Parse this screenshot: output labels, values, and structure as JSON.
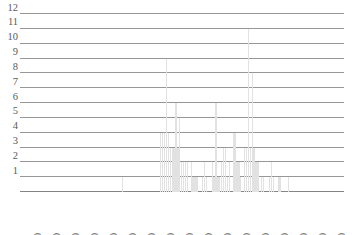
{
  "chart_data": {
    "type": "bar",
    "title": "",
    "subtitle": "",
    "xlabel": "",
    "ylabel": "",
    "legend": [],
    "grid": true,
    "legend_position": "none",
    "xlim": [
      1535,
      1705
    ],
    "ylim": [
      0,
      12
    ],
    "y_ticks": [
      1,
      2,
      3,
      4,
      5,
      6,
      7,
      8,
      9,
      10,
      11,
      12
    ],
    "x_ticks": [
      1540,
      1550,
      1560,
      1570,
      1580,
      1590,
      1600,
      1610,
      1620,
      1630,
      1640,
      1650,
      1660,
      1670,
      1680,
      1690,
      1700
    ],
    "x_tick_labels": [
      "1540",
      "1550",
      "1560",
      "1570",
      "1580",
      "1590",
      "1600",
      "1610",
      "1620",
      "1630",
      "1640",
      "1650",
      "1660",
      "1670",
      "1680",
      "1690",
      "1700"
    ],
    "bar_color": "#e2e2e2",
    "grid_color": "#6f6f6f",
    "categories": [
      1589,
      1609,
      1610,
      1611,
      1612,
      1613,
      1614,
      1615,
      1616,
      1617,
      1618,
      1619,
      1620,
      1621,
      1622,
      1623,
      1625,
      1626,
      1627,
      1628,
      1631,
      1632,
      1633,
      1636,
      1637,
      1638,
      1639,
      1640,
      1641,
      1642,
      1643,
      1644,
      1645,
      1647,
      1648,
      1649,
      1650,
      1651,
      1653,
      1654,
      1655,
      1656,
      1657,
      1658,
      1659,
      1660,
      1662,
      1663,
      1666,
      1667,
      1668,
      1671,
      1672,
      1676
    ],
    "values": [
      1,
      4,
      4,
      4,
      9,
      4,
      3,
      3,
      3,
      6,
      3,
      5,
      2,
      2,
      2,
      2,
      2,
      1,
      1,
      1,
      1,
      2,
      1,
      2,
      1,
      6,
      1,
      1,
      2,
      3,
      3,
      1,
      2,
      4,
      4,
      2,
      2,
      1,
      3,
      3,
      11,
      3,
      8,
      3,
      2,
      2,
      1,
      1,
      1,
      2,
      1,
      1,
      1,
      1
    ]
  }
}
